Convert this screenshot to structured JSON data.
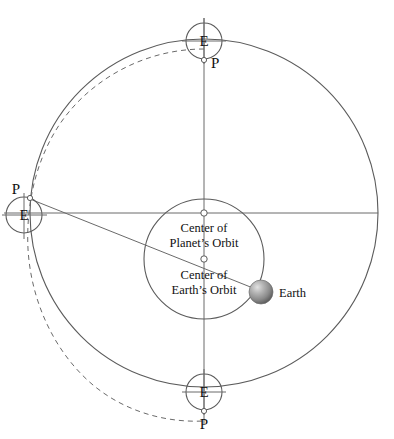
{
  "diagram": {
    "colors": {
      "stroke": "#5b5b5b",
      "dashed_stroke": "#6a6a6a",
      "text": "#111111",
      "background": "#ffffff",
      "earth_sphere_light": "#d8d8d8",
      "earth_sphere_mid": "#9a9a9a",
      "earth_sphere_dark": "#5e5e5e"
    },
    "labels": {
      "center_planets_orbit_line1": "Center of",
      "center_planets_orbit_line2": "Planet’s Orbit",
      "center_earths_orbit_line1": "Center of",
      "center_earths_orbit_line2": "Earth’s Orbit",
      "earth": "Earth"
    },
    "epicycles": [
      {
        "name": "top",
        "earth_label": "E",
        "planet_label": "P",
        "cx": 204,
        "cy": 41,
        "r": 18
      },
      {
        "name": "left",
        "earth_label": "E",
        "planet_label": "P",
        "cx": 24,
        "cy": 215,
        "r": 18
      },
      {
        "name": "bottom",
        "earth_label": "E",
        "planet_label": "P",
        "cx": 204,
        "cy": 392,
        "r": 18
      }
    ],
    "circles": {
      "outer_orbit": {
        "cx": 204,
        "cy": 213,
        "r": 174
      },
      "inner_orbit": {
        "cx": 204,
        "cy": 259,
        "r": 60
      }
    },
    "centers": {
      "planets_orbit_point": {
        "x": 204,
        "y": 213
      },
      "earths_orbit_point": {
        "x": 204,
        "y": 259
      }
    },
    "earth_body": {
      "x": 261,
      "y": 292,
      "r": 12
    },
    "axes": {
      "vertical_line": {
        "x": 204,
        "y1": 18,
        "y2": 425
      },
      "horizontal_line": {
        "y": 213,
        "x1": 4,
        "x2": 378
      }
    },
    "sight_line": {
      "from_x": 30,
      "from_y": 199,
      "to_x": 266,
      "to_y": 293
    }
  }
}
